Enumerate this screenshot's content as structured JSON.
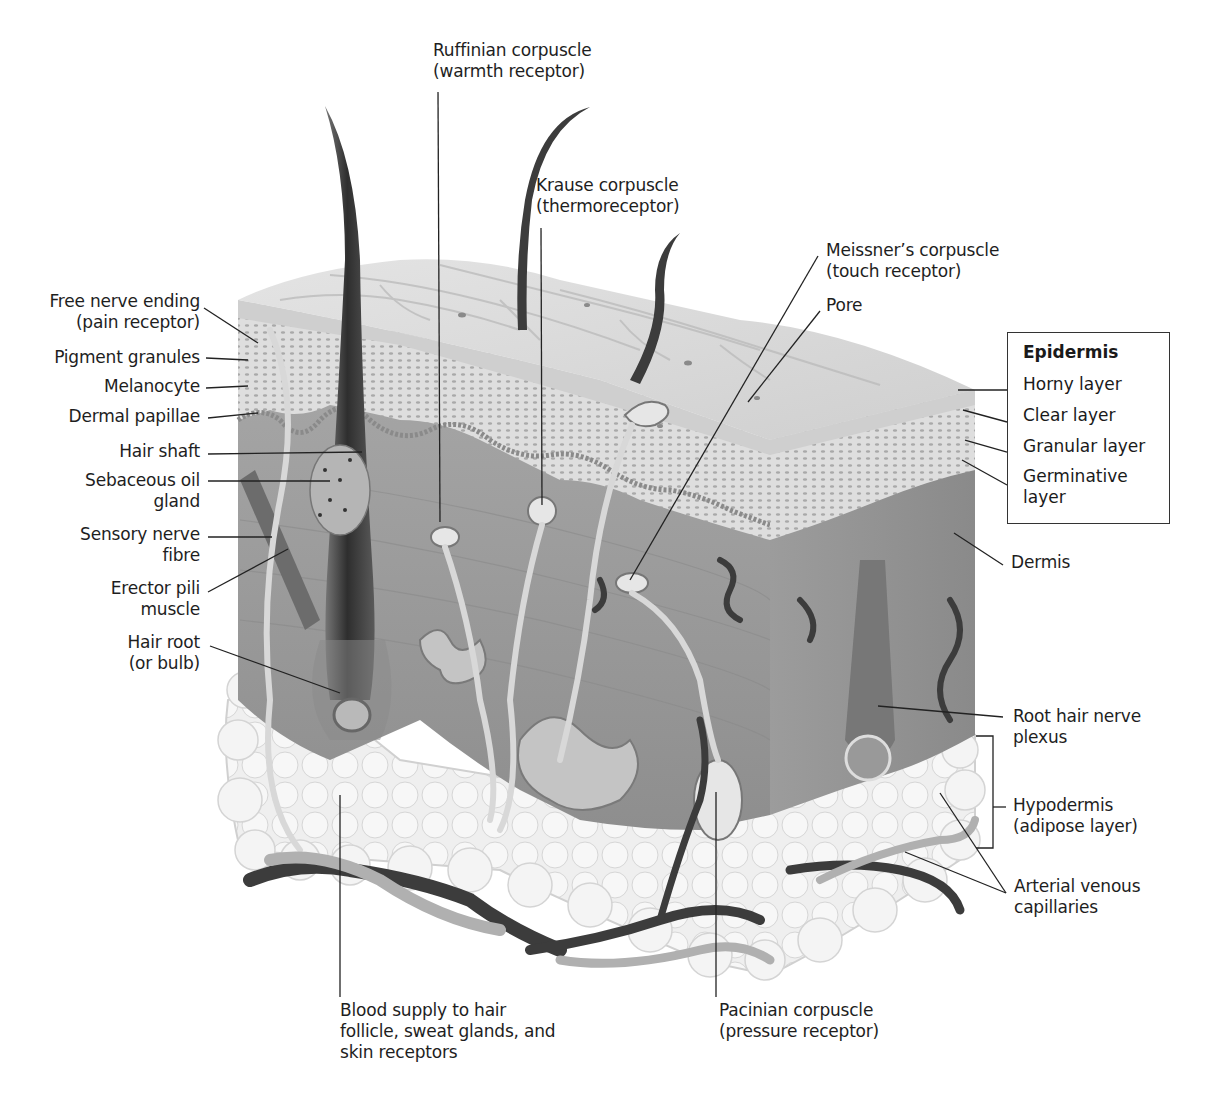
{
  "diagram": {
    "left_labels": [
      {
        "id": "free-nerve-ending",
        "text": "Free nerve ending\n(pain receptor)"
      },
      {
        "id": "pigment-granules",
        "text": "Pigment granules"
      },
      {
        "id": "melanocyte",
        "text": "Melanocyte"
      },
      {
        "id": "dermal-papillae",
        "text": "Dermal papillae"
      },
      {
        "id": "hair-shaft",
        "text": "Hair shaft"
      },
      {
        "id": "sebaceous-oil-gland",
        "text": "Sebaceous oil\ngland"
      },
      {
        "id": "sensory-nerve-fibre",
        "text": "Sensory nerve\nfibre"
      },
      {
        "id": "erector-pili-muscle",
        "text": "Erector pili\nmuscle"
      },
      {
        "id": "hair-root",
        "text": "Hair root\n(or bulb)"
      }
    ],
    "top_labels": [
      {
        "id": "ruffinian-corpuscle",
        "text": "Ruffinian corpuscle\n(warmth receptor)"
      },
      {
        "id": "krause-corpuscle",
        "text": "Krause corpuscle\n(thermoreceptor)"
      },
      {
        "id": "meissners-corpuscle",
        "text": "Meissner’s corpuscle\n(touch receptor)"
      },
      {
        "id": "pore",
        "text": "Pore"
      }
    ],
    "epidermis_legend": {
      "title": "Epidermis",
      "items": [
        "Horny layer",
        "Clear layer",
        "Granular layer",
        "Germinative\nlayer"
      ]
    },
    "right_labels": [
      {
        "id": "dermis",
        "text": "Dermis"
      },
      {
        "id": "root-hair-nerve-plexus",
        "text": "Root hair nerve\nplexus"
      },
      {
        "id": "hypodermis",
        "text": "Hypodermis\n(adipose layer)"
      },
      {
        "id": "arterial-venous-capillaries",
        "text": "Arterial venous\ncapillaries"
      }
    ],
    "bottom_labels": [
      {
        "id": "blood-supply",
        "text": "Blood supply to hair\nfollicle, sweat glands, and\nskin receptors"
      },
      {
        "id": "pacinian-corpuscle",
        "text": "Pacinian corpuscle\n(pressure receptor)"
      }
    ],
    "colors": {
      "epidermis_top": "#d9d9d9",
      "dermis": "#9a9a9a",
      "hypodermis": "#ececec",
      "hair": "#3a3a3a",
      "vessel_dark": "#3c3c3c",
      "vessel_light": "#b8b8b8",
      "leader_line": "#222222"
    }
  }
}
